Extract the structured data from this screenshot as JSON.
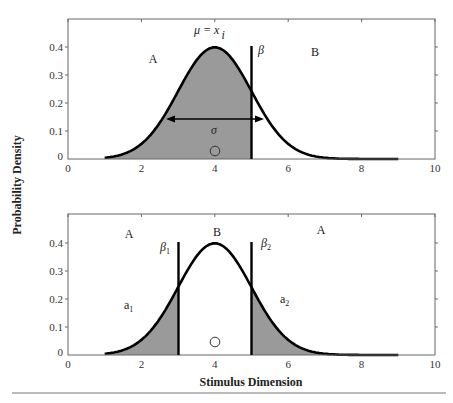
{
  "chart_data": [
    {
      "type": "area",
      "panel": "top",
      "title": "",
      "xlabel": "",
      "ylabel": "Probability Density",
      "xlim": [
        0,
        10
      ],
      "ylim": [
        0,
        0.5
      ],
      "x_ticks": [
        "0",
        "2",
        "4",
        "6",
        "8",
        "10"
      ],
      "y_ticks": [
        "0",
        "0.1",
        "0.2",
        "0.3",
        "0.4"
      ],
      "series": [
        {
          "name": "normal density",
          "mean": 4,
          "sd": 1,
          "x_range": [
            1,
            9
          ],
          "peak": 0.4
        }
      ],
      "shaded_region": {
        "from": 1,
        "to": 5
      },
      "criterion": {
        "label": "β",
        "x": 5,
        "y_top": 0.4
      },
      "annotations": {
        "mean_label": "μ = x",
        "mean_subscript": "i",
        "sigma_label": "σ",
        "sigma_arrow": [
          2.6,
          5.4
        ],
        "region_left": "A",
        "region_right": "B",
        "stimulus_marker_x": 4
      },
      "grid": false
    },
    {
      "type": "area",
      "panel": "bottom",
      "title": "",
      "xlabel": "Stimulus Dimension",
      "ylabel": "Probability Density",
      "xlim": [
        0,
        10
      ],
      "ylim": [
        0,
        0.5
      ],
      "x_ticks": [
        "0",
        "2",
        "4",
        "6",
        "8",
        "10"
      ],
      "y_ticks": [
        "0",
        "0.1",
        "0.2",
        "0.3",
        "0.4"
      ],
      "series": [
        {
          "name": "normal density",
          "mean": 4,
          "sd": 1,
          "x_range": [
            1,
            9
          ],
          "peak": 0.4
        }
      ],
      "shaded_regions": [
        {
          "from": 1,
          "to": 3,
          "label": "a1"
        },
        {
          "from": 5,
          "to": 9,
          "label": "a2"
        }
      ],
      "criteria": [
        {
          "label": "β1",
          "x": 3,
          "y_top": 0.4
        },
        {
          "label": "β2",
          "x": 5,
          "y_top": 0.4
        }
      ],
      "annotations": {
        "region_left": "A",
        "region_middle": "B",
        "region_right": "A",
        "stimulus_marker_x": 4
      },
      "grid": false
    }
  ],
  "labels": {
    "y_axis": "Probability Density",
    "x_axis": "Stimulus Dimension",
    "top": {
      "A": "A",
      "B": "B",
      "beta": "β",
      "mu": "μ = x",
      "mu_sub": "i",
      "sigma": "σ"
    },
    "bottom": {
      "A_left": "A",
      "B": "B",
      "A_right": "A",
      "beta1": "β",
      "beta1_sub": "1",
      "beta2": "β",
      "beta2_sub": "2",
      "a1": "a",
      "a1_sub": "1",
      "a2": "a",
      "a2_sub": "2"
    },
    "x_ticks": [
      "0",
      "2",
      "4",
      "6",
      "8",
      "10"
    ],
    "y_ticks": [
      "0",
      "0.1",
      "0.2",
      "0.3",
      "0.4"
    ]
  },
  "colors": {
    "fill": "#9a9a9a",
    "curve": "#000000",
    "axis": "#555555"
  }
}
